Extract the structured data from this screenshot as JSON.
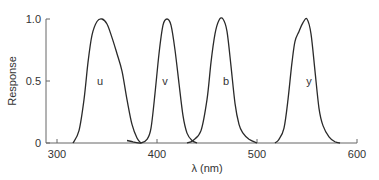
{
  "chart_data": {
    "type": "line",
    "title": "",
    "xlabel": "λ (nm)",
    "ylabel": "Response",
    "xlim": [
      290,
      600
    ],
    "ylim": [
      0,
      1.0
    ],
    "x_ticks": [
      300,
      400,
      500,
      600
    ],
    "y_ticks": [
      0,
      0.5,
      1.0
    ],
    "y_tick_labels": [
      "0",
      "0.5",
      "1.0"
    ],
    "grid": false,
    "legend": "none (curves labeled inline)",
    "series": [
      {
        "name": "u",
        "label_pos": [
          343,
          0.5
        ],
        "points": [
          [
            316,
            0
          ],
          [
            322,
            0.1
          ],
          [
            327,
            0.35
          ],
          [
            331,
            0.65
          ],
          [
            335,
            0.87
          ],
          [
            340,
            0.98
          ],
          [
            345,
            1.0
          ],
          [
            350,
            0.96
          ],
          [
            355,
            0.85
          ],
          [
            360,
            0.72
          ],
          [
            365,
            0.58
          ],
          [
            370,
            0.35
          ],
          [
            375,
            0.15
          ],
          [
            380,
            0.04
          ],
          [
            384,
            0
          ]
        ]
      },
      {
        "name": "v",
        "label_pos": [
          408,
          0.5
        ],
        "points": [
          [
            370,
            0.02
          ],
          [
            376,
            0.01
          ],
          [
            384,
            0
          ],
          [
            390,
            0.03
          ],
          [
            394,
            0.12
          ],
          [
            398,
            0.4
          ],
          [
            402,
            0.72
          ],
          [
            406,
            0.95
          ],
          [
            410,
            1.0
          ],
          [
            414,
            0.95
          ],
          [
            418,
            0.75
          ],
          [
            422,
            0.48
          ],
          [
            426,
            0.22
          ],
          [
            430,
            0.08
          ],
          [
            435,
            0.02
          ],
          [
            440,
            0
          ]
        ]
      },
      {
        "name": "b",
        "label_pos": [
          469,
          0.5
        ],
        "points": [
          [
            430,
            0
          ],
          [
            436,
            0.02
          ],
          [
            444,
            0.1
          ],
          [
            450,
            0.35
          ],
          [
            454,
            0.65
          ],
          [
            458,
            0.88
          ],
          [
            462,
            0.99
          ],
          [
            466,
            1.0
          ],
          [
            470,
            0.9
          ],
          [
            474,
            0.62
          ],
          [
            478,
            0.32
          ],
          [
            482,
            0.15
          ],
          [
            486,
            0.08
          ],
          [
            492,
            0.03
          ],
          [
            500,
            0
          ]
        ]
      },
      {
        "name": "y",
        "label_pos": [
          552,
          0.5
        ],
        "points": [
          [
            518,
            0
          ],
          [
            522,
            0.03
          ],
          [
            527,
            0.12
          ],
          [
            531,
            0.35
          ],
          [
            535,
            0.65
          ],
          [
            538,
            0.82
          ],
          [
            542,
            0.9
          ],
          [
            546,
            0.97
          ],
          [
            550,
            1.0
          ],
          [
            554,
            0.88
          ],
          [
            558,
            0.58
          ],
          [
            562,
            0.28
          ],
          [
            566,
            0.14
          ],
          [
            572,
            0.05
          ],
          [
            578,
            0.01
          ],
          [
            583,
            0
          ]
        ]
      }
    ]
  },
  "colors": {
    "curve": "#2a2a2a",
    "axis": "#666666",
    "text": "#333333",
    "background": "#ffffff"
  }
}
